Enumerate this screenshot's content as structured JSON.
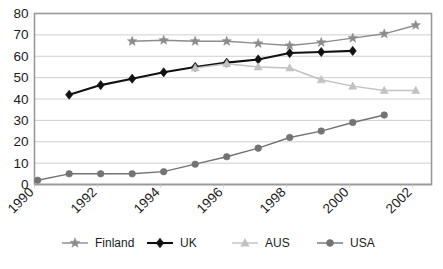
{
  "chart_data": {
    "type": "line",
    "title": "",
    "subtitle": "",
    "xlabel": "",
    "ylabel": "",
    "xlim": [
      1990,
      2002.6
    ],
    "ylim": [
      0,
      80
    ],
    "grid": true,
    "legend_position": "bottom",
    "x_tick_labels": [
      "1990",
      "1992",
      "1994",
      "1996",
      "1998",
      "2000",
      "2002"
    ],
    "x_tick_values": [
      1990,
      1992,
      1994,
      1996,
      1998,
      2000,
      2002
    ],
    "y_tick_labels": [
      "0",
      "10",
      "20",
      "30",
      "40",
      "50",
      "60",
      "70",
      "80"
    ],
    "y_tick_values": [
      0,
      10,
      20,
      30,
      40,
      50,
      60,
      70,
      80
    ],
    "series": [
      {
        "name": "Finland",
        "marker": "star",
        "color": "#8c8c8c",
        "line_width": 1.4,
        "x": [
          1993.1,
          1994.1,
          1995.1,
          1996.1,
          1997.1,
          1998.1,
          1999.1,
          2000.1,
          2001.1,
          2002.1
        ],
        "values": [
          67,
          67.5,
          67,
          67,
          66,
          65,
          66.5,
          68.5,
          70.5,
          74.5
        ]
      },
      {
        "name": "UK",
        "marker": "diamond",
        "color": "#111111",
        "line_width": 2.1,
        "x": [
          1991.1,
          1992.1,
          1993.1,
          1994.1,
          1995.1,
          1996.1,
          1997.1,
          1998.1,
          1999.1,
          2000.1
        ],
        "values": [
          42,
          46.5,
          49.5,
          52.5,
          55,
          57,
          58.5,
          61.5,
          62,
          62.5
        ]
      },
      {
        "name": "AUS",
        "marker": "triangle",
        "color": "#c2c2c2",
        "line_width": 1.4,
        "x": [
          1995.1,
          1996.1,
          1997.1,
          1998.1,
          1999.1,
          2000.1,
          2001.1,
          2002.1
        ],
        "values": [
          54.5,
          56.5,
          55,
          54.5,
          49,
          46,
          44,
          44
        ]
      },
      {
        "name": "USA",
        "marker": "circle",
        "color": "#737373",
        "line_width": 1.4,
        "x": [
          1990.1,
          1991.1,
          1992.1,
          1993.1,
          1994.1,
          1995.1,
          1996.1,
          1997.1,
          1998.1,
          1999.1,
          2000.1,
          2001.1
        ],
        "values": [
          2,
          5,
          5,
          5,
          6,
          9.5,
          13,
          17,
          22,
          25,
          29,
          32.5
        ]
      }
    ]
  },
  "legend": {
    "entries": [
      {
        "label": "Finland",
        "marker": "star",
        "color": "#8c8c8c"
      },
      {
        "label": "UK",
        "marker": "diamond",
        "color": "#111111"
      },
      {
        "label": "AUS",
        "marker": "triangle",
        "color": "#c2c2c2"
      },
      {
        "label": "USA",
        "marker": "circle",
        "color": "#737373"
      }
    ]
  },
  "watermark": {
    "text": ""
  }
}
